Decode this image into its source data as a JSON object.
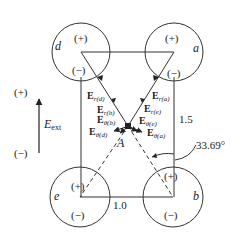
{
  "figure": {
    "charges": [
      {
        "id": "d",
        "label": "d",
        "top_sign": "(+)",
        "bottom_sign": "(−)"
      },
      {
        "id": "a",
        "label": "a",
        "top_sign": "(+)",
        "bottom_sign": "(−)"
      },
      {
        "id": "e",
        "label": "e",
        "top_sign": "(+)",
        "bottom_sign": "(−)"
      },
      {
        "id": "b",
        "label": "b",
        "top_sign": "(+)",
        "bottom_sign": "(−)"
      }
    ],
    "point_label": "A",
    "dimensions": {
      "width": "1.0",
      "height": "1.5"
    },
    "angle": "33.69°",
    "external_field": {
      "plus": "(+)",
      "minus": "(−)",
      "label_main": "E",
      "label_sub": "ext"
    },
    "vectors": [
      {
        "main": "E",
        "sub": "r(d)"
      },
      {
        "main": "E",
        "sub": "r(b)"
      },
      {
        "main": "E",
        "sub": "θ(b)"
      },
      {
        "main": "E",
        "sub": "θ(d)"
      },
      {
        "main": "E",
        "sub": "r(a)"
      },
      {
        "main": "E",
        "sub": "r(e)"
      },
      {
        "main": "E",
        "sub": "θ(e)"
      },
      {
        "main": "E",
        "sub": "θ(a)"
      }
    ]
  }
}
